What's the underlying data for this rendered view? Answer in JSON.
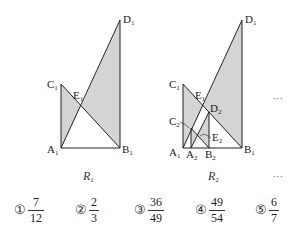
{
  "figure1": {
    "caption": "R",
    "caption_sub": "1",
    "labels": {
      "A": "A",
      "A_sub": "1",
      "B": "B",
      "B_sub": "1",
      "C": "C",
      "C_sub": "1",
      "D": "D",
      "D_sub": "1",
      "E": "E",
      "E_sub": "1"
    }
  },
  "figure2": {
    "caption": "R",
    "caption_sub": "2",
    "labels": {
      "A1": "A",
      "A1_sub": "1",
      "B1": "B",
      "B1_sub": "1",
      "C1": "C",
      "C1_sub": "1",
      "D1": "D",
      "D1_sub": "1",
      "E1": "E",
      "E1_sub": "1",
      "A2": "A",
      "A2_sub": "2",
      "B2": "B",
      "B2_sub": "2",
      "C2": "C",
      "C2_sub": "2",
      "D2": "D",
      "D2_sub": "2",
      "E2": "E",
      "E2_sub": "2"
    },
    "ellipsis_right": "···",
    "ellipsis_caption": "···"
  },
  "colors": {
    "shade": "#d4d4d4",
    "line": "#222222"
  },
  "choices": [
    {
      "marker": "①",
      "numerator": "7",
      "denominator": "12"
    },
    {
      "marker": "②",
      "numerator": "2",
      "denominator": "3"
    },
    {
      "marker": "③",
      "numerator": "36",
      "denominator": "49"
    },
    {
      "marker": "④",
      "numerator": "49",
      "denominator": "54"
    },
    {
      "marker": "⑤",
      "numerator": "6",
      "denominator": "7"
    }
  ]
}
